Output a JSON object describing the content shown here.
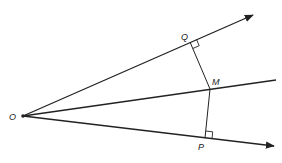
{
  "diagram": {
    "points": {
      "O": {
        "label": "O",
        "x": 23,
        "y": 116
      },
      "Q": {
        "label": "Q",
        "x": 190,
        "y": 42
      },
      "M": {
        "label": "M",
        "x": 210,
        "y": 89
      },
      "P": {
        "label": "P",
        "x": 205,
        "y": 138
      }
    },
    "labels": {
      "O": "O",
      "Q": "Q",
      "M": "M",
      "P": "P"
    },
    "rays": [
      {
        "name": "upper-ray",
        "from": "O",
        "to": [
          253,
          15
        ],
        "arrow": true
      },
      {
        "name": "bisector",
        "from": "O",
        "to": [
          276,
          80
        ],
        "arrow": false
      },
      {
        "name": "lower-ray",
        "from": "O",
        "to": [
          274,
          146
        ],
        "arrow": true
      }
    ],
    "segments": [
      {
        "name": "MQ",
        "from": "M",
        "to": "Q"
      },
      {
        "name": "MP",
        "from": "M",
        "to": "P"
      }
    ],
    "right_angles": [
      "Q",
      "P"
    ],
    "colors": {
      "stroke": "#222222",
      "background": "#ffffff"
    }
  }
}
